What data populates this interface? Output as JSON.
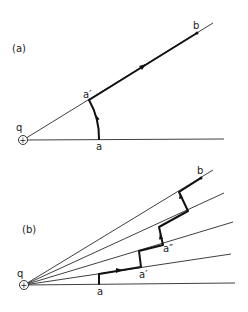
{
  "figure": {
    "panels": [
      {
        "id": "a",
        "label": "(a)",
        "points": {
          "charge": "q",
          "start": "a",
          "projected": "a′",
          "end": "b"
        },
        "description": "Path from a rotated along circular arc about q to a′, then radially outward to b"
      },
      {
        "id": "b",
        "label": "(b)",
        "points": {
          "charge": "q",
          "start": "a",
          "step1": "a′",
          "step2": "a″",
          "end": "b"
        },
        "description": "Staircase path of alternating radial and arc segments between rays from q"
      }
    ],
    "charge_symbol": "+",
    "colors": {
      "ink": "#111111",
      "background": "#ffffff"
    }
  }
}
